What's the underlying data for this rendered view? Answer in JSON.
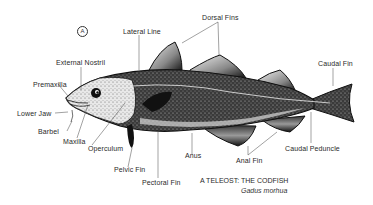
{
  "figure": {
    "marker": "A",
    "caption": {
      "title": "A TELEOST: THE CODFISH",
      "scientific_name": "Gadus morhua"
    },
    "labels": {
      "lateral_line": "Lateral Line",
      "dorsal_fins": "Dorsal Fins",
      "caudal_fin": "Caudal Fin",
      "external_nostril": "External Nostril",
      "premaxilla": "Premaxilla",
      "lower_jaw": "Lower Jaw",
      "barbel": "Barbel",
      "maxilla": "Maxilla",
      "operculum": "Operculum",
      "pelvic_fin": "Pelvic Fin",
      "pectoral_fin": "Pectoral Fin",
      "anus": "Anus",
      "anal_fin": "Anal Fin",
      "caudal_peduncle": "Caudal Peduncle"
    },
    "colors": {
      "ink": "#111111",
      "label": "#2a2a2a",
      "background": "#ffffff"
    }
  }
}
